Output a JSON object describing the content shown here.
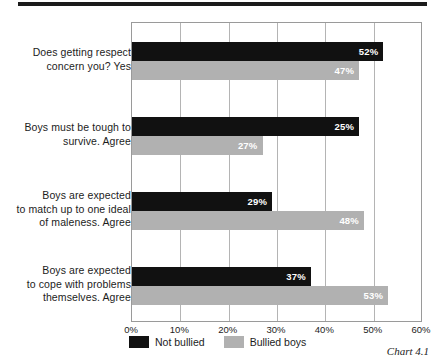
{
  "caption": "Chart 4.1",
  "chart_data": {
    "type": "bar",
    "orientation": "horizontal",
    "title": "",
    "subtitle": "",
    "xlabel": "",
    "ylabel": "",
    "xlim": [
      0,
      60
    ],
    "xticks": [
      0,
      10,
      20,
      30,
      40,
      50,
      60
    ],
    "xtick_labels": [
      "0%",
      "10%",
      "20%",
      "30%",
      "40%",
      "50%",
      "60%"
    ],
    "grid": true,
    "grid_axis": "x",
    "legend_position": "bottom-left",
    "value_label_suffix": "%",
    "categories": [
      "Does getting respect concern you? Yes",
      "Boys must be tough to survive. Agree",
      "Boys are expected to match up to one ideal of maleness. Agree",
      "Boys are expected to cope with problems themselves. Agree"
    ],
    "category_lines": [
      [
        "Does getting respect",
        "concern you? Yes"
      ],
      [
        "Boys must be tough to",
        "survive. Agree"
      ],
      [
        "Boys are expected",
        "to match up to one ideal",
        "of maleness. Agree"
      ],
      [
        "Boys are expected",
        "to cope with problems",
        "themselves. Agree"
      ]
    ],
    "series": [
      {
        "name": "Not bullied",
        "color": "#111111",
        "values": [
          52,
          47,
          29,
          37
        ],
        "value_labels": [
          "52%",
          "25%",
          "29%",
          "37%"
        ]
      },
      {
        "name": "Bullied boys",
        "color": "#b1b1b1",
        "values": [
          47,
          27,
          48,
          53
        ],
        "value_labels": [
          "47%",
          "27%",
          "48%",
          "53%"
        ]
      }
    ],
    "data_points": [
      {
        "category": "Does getting respect concern you? Yes",
        "not_bullied": 52,
        "bullied_boys": 47
      },
      {
        "category": "Boys must be tough to survive. Agree",
        "not_bullied": 25,
        "bullied_boys": 27
      },
      {
        "category": "Boys are expected to match up to one ideal of maleness. Agree",
        "not_bullied": 29,
        "bullied_boys": 48
      },
      {
        "category": "Boys are expected to cope with problems themselves. Agree",
        "not_bullied": 37,
        "bullied_boys": 53
      }
    ],
    "legend": [
      {
        "label": "Not bullied",
        "color": "#111111"
      },
      {
        "label": "Bullied boys",
        "color": "#b1b1b1"
      }
    ]
  }
}
